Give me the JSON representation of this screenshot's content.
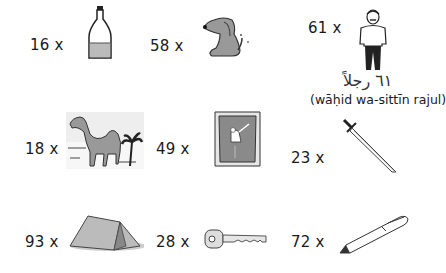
{
  "items": [
    {
      "count": "16 x",
      "object": "bottle"
    },
    {
      "count": "58 x",
      "object": "dog"
    },
    {
      "count": "61 x",
      "object": "man",
      "arabic": "٦١ رجلاً",
      "transliteration": "(wāḥid wa-sittīn rajul)"
    },
    {
      "count": "18 x",
      "object": "camel"
    },
    {
      "count": "49 x",
      "object": "carpet"
    },
    {
      "count": "23 x",
      "object": "sword"
    },
    {
      "count": "93 x",
      "object": "tent"
    },
    {
      "count": "28 x",
      "object": "key"
    },
    {
      "count": "72 x",
      "object": "pen"
    }
  ]
}
